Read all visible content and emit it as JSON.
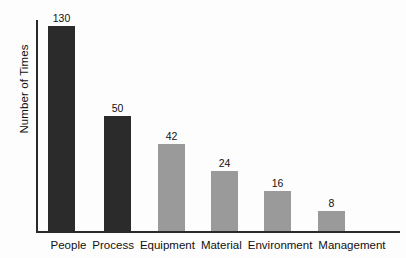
{
  "chart_data": {
    "type": "bar",
    "title": "",
    "subtitle": "",
    "xlabel": "",
    "ylabel": "Number of Times",
    "categories": [
      "People",
      "Process",
      "Equipment",
      "Material",
      "Environment",
      "Management"
    ],
    "values": [
      130,
      50,
      42,
      24,
      16,
      8
    ],
    "value_labels": [
      "130",
      "50",
      "42",
      "24",
      "16",
      "8"
    ],
    "bar_colors": [
      "#2b2b2b",
      "#2b2b2b",
      "#9a9a9a",
      "#9a9a9a",
      "#9a9a9a",
      "#9a9a9a"
    ],
    "bar_pixel_heights": [
      205,
      115,
      87,
      60,
      40,
      20
    ],
    "legend": [],
    "legend_position": "none",
    "grid": false,
    "y_tick_labels": [],
    "axis_color": "#2a2a2a",
    "background_color": "#fdfdfd",
    "note": "Pareto-style bar chart; vertical scale is not linear from zero"
  },
  "axes": {
    "y_title": "Number of Times"
  }
}
